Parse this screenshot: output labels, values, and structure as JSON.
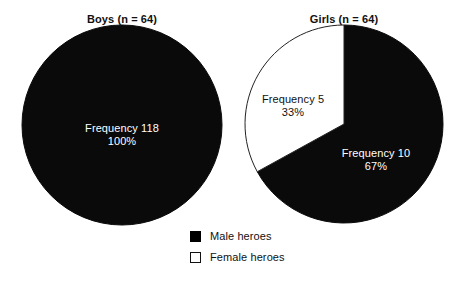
{
  "figure": {
    "background_color": "#ffffff",
    "width": 460,
    "height": 290
  },
  "chart_data": {
    "type": "pie",
    "title": "",
    "panels": [
      {
        "id": "boys",
        "title": "Boys (n = 64)",
        "center_x": 122,
        "center_y": 125,
        "radius": 100,
        "start_angle_deg": 0,
        "slices": [
          {
            "name": "Male heroes",
            "frequency": 118,
            "percent": 100,
            "value": 100,
            "color": "#0a0a0a",
            "edge_color": "#0a0a0a",
            "label_line1": "Frequency 118",
            "label_line2": "100%",
            "label_x": 122,
            "label_y": 135,
            "label_color": "#ffffff"
          }
        ]
      },
      {
        "id": "girls",
        "title": "Girls (n = 64)",
        "center_x": 344,
        "center_y": 124,
        "radius": 99,
        "start_angle_deg": 0,
        "slices": [
          {
            "name": "Male heroes",
            "frequency": 10,
            "percent": 67,
            "value": 67,
            "color": "#0a0a0a",
            "edge_color": "#0a0a0a",
            "label_line1": "Frequency 10",
            "label_line2": "67%",
            "label_x": 376,
            "label_y": 160,
            "label_color": "#ffffff"
          },
          {
            "name": "Female heroes",
            "frequency": 5,
            "percent": 33,
            "value": 33,
            "color": "#ffffff",
            "edge_color": "#222222",
            "label_line1": "Frequency 5",
            "label_line2": "33%",
            "label_x": 293,
            "label_y": 106,
            "label_color": "#111111"
          }
        ]
      }
    ],
    "legend": {
      "position": "bottom-center",
      "entries": [
        {
          "label": "Male heroes",
          "swatch": "filled",
          "color": "#000000"
        },
        {
          "label": "Female heroes",
          "swatch": "hollow",
          "color": "#ffffff"
        }
      ]
    }
  }
}
